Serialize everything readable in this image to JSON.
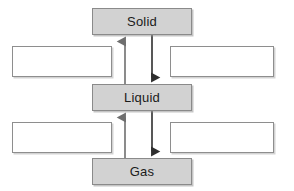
{
  "diagram": {
    "background_color": "#ffffff",
    "state_box_fill": "#d2d2d2",
    "state_box_border": "#8a8a8a",
    "blank_box_fill": "#ffffff",
    "blank_box_border": "#8e8e8e",
    "arrow_color": "#3a3a3a",
    "arrow_color_light": "#6f6f6f",
    "states": [
      {
        "id": "solid",
        "label": "Solid",
        "x": 92,
        "y": 8,
        "w": 100,
        "h": 27
      },
      {
        "id": "liquid",
        "label": "Liquid",
        "x": 92,
        "y": 84,
        "w": 100,
        "h": 27
      },
      {
        "id": "gas",
        "label": "Gas",
        "x": 92,
        "y": 158,
        "w": 100,
        "h": 27
      }
    ],
    "blanks": [
      {
        "id": "blank-upper-left",
        "label": "",
        "x": 12,
        "y": 46,
        "w": 100,
        "h": 31
      },
      {
        "id": "blank-upper-right",
        "label": "",
        "x": 170,
        "y": 46,
        "w": 104,
        "h": 31
      },
      {
        "id": "blank-lower-left",
        "label": "",
        "x": 12,
        "y": 122,
        "w": 100,
        "h": 31
      },
      {
        "id": "blank-lower-right",
        "label": "",
        "x": 170,
        "y": 122,
        "w": 104,
        "h": 31
      }
    ],
    "arrows": [
      {
        "id": "arrow-liquid-to-solid",
        "from": "liquid",
        "to": "solid",
        "direction": "up",
        "x": 125,
        "y_start": 84,
        "y_end": 36
      },
      {
        "id": "arrow-solid-to-liquid",
        "from": "solid",
        "to": "liquid",
        "direction": "down",
        "x": 152,
        "y_start": 35,
        "y_end": 83
      },
      {
        "id": "arrow-gas-to-liquid",
        "from": "gas",
        "to": "liquid",
        "direction": "up",
        "x": 125,
        "y_start": 158,
        "y_end": 112
      },
      {
        "id": "arrow-liquid-to-gas",
        "from": "liquid",
        "to": "gas",
        "direction": "down",
        "x": 152,
        "y_start": 111,
        "y_end": 157
      }
    ]
  }
}
